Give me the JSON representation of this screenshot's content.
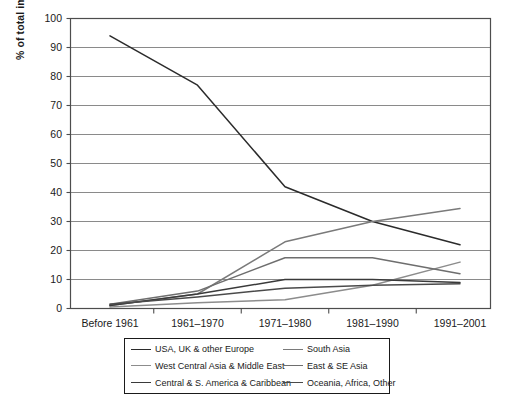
{
  "chart_data": {
    "type": "line",
    "title": "",
    "xlabel": "",
    "ylabel": "% of total immigrant population",
    "categories": [
      "Before 1961",
      "1961–1970",
      "1971–1980",
      "1981–1990",
      "1991–2001"
    ],
    "ylim": [
      0,
      100
    ],
    "yticks": [
      0,
      10,
      20,
      30,
      40,
      50,
      60,
      70,
      80,
      90,
      100
    ],
    "grid": "horizontal",
    "legend_position": "below-plot",
    "series": [
      {
        "name": "USA, UK & other Europe",
        "color": "#2b2b2b",
        "values": [
          94,
          77,
          42,
          30,
          22
        ]
      },
      {
        "name": "South Asia",
        "color": "#7a7a7a",
        "values": [
          1,
          5,
          23,
          30,
          34.5
        ]
      },
      {
        "name": "West Central Asia & Middle East",
        "color": "#8c8c8c",
        "values": [
          0.5,
          2,
          3,
          8,
          16
        ]
      },
      {
        "name": "East & SE Asia",
        "color": "#6e6e6e",
        "values": [
          1.5,
          6,
          17.5,
          17.5,
          12
        ]
      },
      {
        "name": "Central & S. America & Caribbean",
        "color": "#3a3a3a",
        "values": [
          1,
          5,
          10,
          10,
          9
        ]
      },
      {
        "name": "Oceania, Africa, Other",
        "color": "#4a4a4a",
        "values": [
          1.5,
          4,
          7,
          8,
          8.5
        ]
      }
    ]
  },
  "axis": {
    "y_title": "% of total immigrant population",
    "y_tick_labels": [
      "100",
      "90",
      "80",
      "70",
      "60",
      "50",
      "40",
      "30",
      "20",
      "10",
      "0"
    ],
    "x_tick_labels": [
      "Before 1961",
      "1961–1970",
      "1971–1980",
      "1981–1990",
      "1991–2001"
    ]
  },
  "legend": {
    "entries": [
      {
        "label": "USA, UK & other Europe",
        "color": "#2b2b2b"
      },
      {
        "label": "South Asia",
        "color": "#7a7a7a"
      },
      {
        "label": "West Central Asia & Middle East",
        "color": "#8c8c8c"
      },
      {
        "label": "East & SE Asia",
        "color": "#6e6e6e"
      },
      {
        "label": "Central & S. America & Caribbean",
        "color": "#3a3a3a"
      },
      {
        "label": "Oceania, Africa, Other",
        "color": "#4a4a4a"
      }
    ]
  },
  "style": {
    "axis_color": "#4d4d4d",
    "grid_color": "#7d7d7d",
    "text_color": "#1a1a1a",
    "background": "#ffffff"
  }
}
